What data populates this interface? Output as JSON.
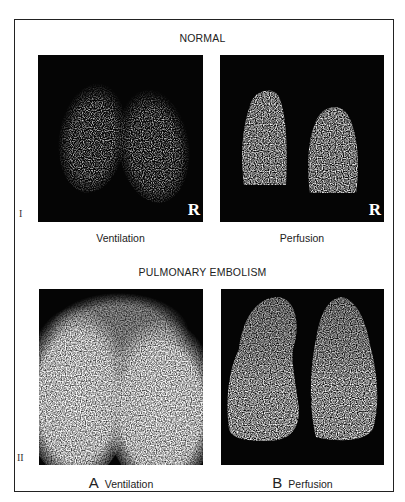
{
  "figure": {
    "section_1": {
      "title": "NORMAL",
      "roman_label": "I",
      "panels": [
        {
          "caption": "Ventilation",
          "orientation_marker": "R",
          "description": "Normal ventilation scan, two symmetric speckled lung fields"
        },
        {
          "caption": "Perfusion",
          "orientation_marker": "R",
          "description": "Normal perfusion scan, two bright rounded lung fields"
        }
      ]
    },
    "section_2": {
      "title": "PULMONARY EMBOLISM",
      "roman_label": "II",
      "panels": [
        {
          "letter": "A",
          "caption": "Ventilation",
          "description": "Ventilation scan with diffuse bright lung fields"
        },
        {
          "letter": "B",
          "caption": "Perfusion",
          "description": "Perfusion scan showing segmental defects in upper lung zones"
        }
      ]
    }
  }
}
